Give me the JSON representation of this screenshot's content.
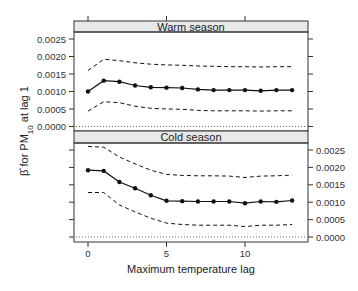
{
  "chart_data": {
    "type": "line",
    "layout": "two stacked panels (trellis), shared x-axis",
    "xlabel": "Maximum temperature lag",
    "ylabel": "β̂ for PM10 at lag 1",
    "ylabel_parts": {
      "beta": "β̂",
      "for_pm": " for PM",
      "sub": "10",
      "rest": " at lag 1"
    },
    "x": [
      0,
      1,
      2,
      3,
      4,
      5,
      6,
      7,
      8,
      9,
      10,
      11,
      12,
      13
    ],
    "x_ticks": [
      0,
      5,
      10
    ],
    "x_tick_labels": [
      "0",
      "5",
      "10"
    ],
    "xlim": [
      -0.9,
      14.0
    ],
    "y_ticks": [
      0.0,
      0.0005,
      0.001,
      0.0015,
      0.002,
      0.0025
    ],
    "y_tick_labels": [
      "0.0000",
      "0.0005",
      "0.0010",
      "0.0015",
      "0.0020",
      "0.0025"
    ],
    "reference_line": {
      "y": 0.0,
      "style": "dotted"
    },
    "grid": false,
    "panels": [
      {
        "title": "Warm season",
        "y_axis_side": "left",
        "ylim": [
          -0.00012,
          0.0027
        ],
        "series": [
          {
            "name": "estimate",
            "style": "solid line with points",
            "values": [
              0.001,
              0.00131,
              0.00128,
              0.00117,
              0.00112,
              0.00111,
              0.0011,
              0.00106,
              0.00104,
              0.00104,
              0.00104,
              0.00102,
              0.00104,
              0.00104
            ]
          },
          {
            "name": "upper 95% CI",
            "style": "dashed",
            "values": [
              0.0016,
              0.00192,
              0.00188,
              0.00182,
              0.00178,
              0.00176,
              0.00175,
              0.00173,
              0.00172,
              0.00171,
              0.00171,
              0.0017,
              0.00171,
              0.00171
            ]
          },
          {
            "name": "lower 95% CI",
            "style": "dashed",
            "values": [
              0.00044,
              0.00071,
              0.00068,
              0.00058,
              0.00052,
              0.0005,
              0.00049,
              0.00046,
              0.00045,
              0.00045,
              0.00045,
              0.00044,
              0.00045,
              0.00045
            ]
          }
        ]
      },
      {
        "title": "Cold season",
        "y_axis_side": "right",
        "ylim": [
          -0.00015,
          0.0028
        ],
        "series": [
          {
            "name": "estimate",
            "style": "solid line with points",
            "values": [
              0.00192,
              0.0019,
              0.00158,
              0.0014,
              0.0012,
              0.00104,
              0.00103,
              0.00102,
              0.00102,
              0.00102,
              0.00097,
              0.00102,
              0.00101,
              0.00105
            ]
          },
          {
            "name": "upper 95% CI",
            "style": "dashed",
            "values": [
              0.0026,
              0.00258,
              0.0023,
              0.0021,
              0.00192,
              0.0018,
              0.00177,
              0.00176,
              0.00176,
              0.00175,
              0.00171,
              0.00175,
              0.00176,
              0.00178
            ]
          },
          {
            "name": "lower 95% CI",
            "style": "dashed",
            "values": [
              0.00128,
              0.00128,
              0.00092,
              0.00072,
              0.00054,
              0.0004,
              0.00036,
              0.00034,
              0.00034,
              0.00034,
              0.0003,
              0.00034,
              0.00034,
              0.00036
            ]
          }
        ]
      }
    ]
  },
  "colors": {
    "line": "#111111",
    "strip_fill": "#e8e8e8",
    "frame": "#333333",
    "reference": "#555555"
  }
}
